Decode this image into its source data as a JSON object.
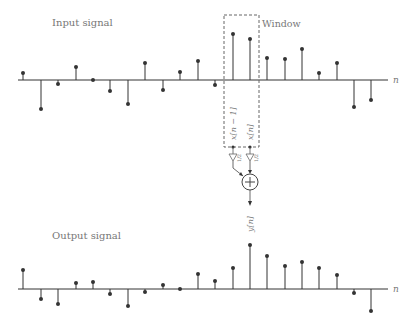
{
  "diagram": {
    "input": {
      "title": "Input signal",
      "axis_label": "n",
      "axis_y": 80,
      "values": [
        7,
        -29,
        -4,
        13,
        0,
        -11,
        -24,
        17,
        -10,
        8,
        19,
        -5,
        46,
        41,
        22,
        21,
        31,
        7,
        17,
        -27,
        -20
      ]
    },
    "output": {
      "title": "Output signal",
      "axis_label": "n",
      "axis_y": 289,
      "values": [
        19,
        -10,
        -15,
        6,
        7,
        -5,
        -17,
        -3,
        4,
        0,
        15,
        8,
        21,
        44,
        33,
        23,
        27,
        21,
        14,
        -4,
        -22
      ]
    },
    "stem_x": [
      23,
      41,
      58,
      76,
      93,
      110,
      128,
      145,
      163,
      180,
      198,
      215,
      233,
      250,
      267,
      285,
      302,
      319,
      337,
      354,
      371
    ],
    "window": {
      "label": "Window",
      "tap_labels": [
        "x[n − 1]",
        "x[n]"
      ],
      "gain_label": "1/2",
      "adder_symbol": "+",
      "output_label": "y[n]"
    },
    "colors": {
      "stem": "#333333",
      "axis": "#333333",
      "dashed": "#666666",
      "text": "#777777"
    }
  }
}
